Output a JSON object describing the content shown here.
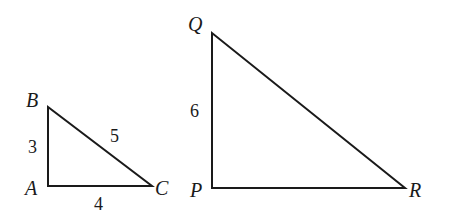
{
  "figure": {
    "type": "geometry-diagram",
    "background_color": "#ffffff",
    "stroke_color": "#1a1a1a",
    "text_color": "#1a1a1a",
    "stroke_width": 2,
    "width": 449,
    "height": 223
  },
  "triangles": [
    {
      "id": "ABC",
      "name": "triangle-abc",
      "right_angle_at": "A",
      "vertices": [
        {
          "id": "A",
          "label": "A",
          "x": 48,
          "y": 186,
          "label_x": 25,
          "label_y": 178
        },
        {
          "id": "B",
          "label": "B",
          "x": 48,
          "y": 107,
          "label_x": 26,
          "label_y": 90
        },
        {
          "id": "C",
          "label": "C",
          "x": 152,
          "y": 186,
          "label_x": 155,
          "label_y": 178
        }
      ],
      "sides": [
        {
          "id": "AB",
          "label": "3",
          "from": "A",
          "to": "B",
          "label_x": 28,
          "label_y": 138
        },
        {
          "id": "AC",
          "label": "4",
          "from": "A",
          "to": "C",
          "label_x": 94,
          "label_y": 195
        },
        {
          "id": "BC",
          "label": "5",
          "from": "B",
          "to": "C",
          "label_x": 110,
          "label_y": 127
        }
      ]
    },
    {
      "id": "PQR",
      "name": "triangle-pqr",
      "right_angle_at": "P",
      "vertices": [
        {
          "id": "P",
          "label": "P",
          "x": 212,
          "y": 188,
          "label_x": 190,
          "label_y": 180
        },
        {
          "id": "Q",
          "label": "Q",
          "x": 212,
          "y": 33,
          "label_x": 188,
          "label_y": 14
        },
        {
          "id": "R",
          "label": "R",
          "x": 405,
          "y": 188,
          "label_x": 409,
          "label_y": 180
        }
      ],
      "sides": [
        {
          "id": "PQ",
          "label": "6",
          "from": "P",
          "to": "Q",
          "label_x": 190,
          "label_y": 102
        },
        {
          "id": "PR",
          "label": "",
          "from": "P",
          "to": "R",
          "label_x": 0,
          "label_y": 0
        },
        {
          "id": "QR",
          "label": "",
          "from": "Q",
          "to": "R",
          "label_x": 0,
          "label_y": 0
        }
      ]
    }
  ]
}
